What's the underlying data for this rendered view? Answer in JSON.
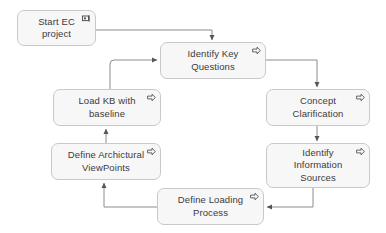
{
  "diagram": {
    "colors": {
      "node_fill": "#f7f7f7",
      "node_border": "#c9c9c9",
      "text": "#3b3b3b",
      "edge": "#8c8c8c",
      "background": "#ffffff"
    },
    "nodes": [
      {
        "id": "start-ec-project",
        "label": "Start EC\nproject",
        "marker": "start-flag-icon",
        "x": 17,
        "y": 10,
        "w": 79,
        "h": 36
      },
      {
        "id": "identify-key-questions",
        "label": "Identify Key\nQuestions",
        "marker": "process-arrow-icon",
        "x": 160,
        "y": 42,
        "w": 106,
        "h": 37
      },
      {
        "id": "concept-clarification",
        "label": "Concept\nClarification",
        "marker": "process-arrow-icon",
        "x": 266,
        "y": 89,
        "w": 104,
        "h": 37
      },
      {
        "id": "identify-information-sources",
        "label": "Identify\nInformation\nSources",
        "marker": "process-arrow-icon",
        "x": 266,
        "y": 143,
        "w": 104,
        "h": 45
      },
      {
        "id": "define-loading-process",
        "label": "Define Loading\nProcess",
        "marker": "process-arrow-icon",
        "x": 157,
        "y": 188,
        "w": 107,
        "h": 37
      },
      {
        "id": "define-archictural-viewpoints",
        "label": "Define Archictural\nViewPoints",
        "marker": "process-arrow-icon",
        "x": 51,
        "y": 143,
        "w": 110,
        "h": 37
      },
      {
        "id": "load-kb-with-baseline",
        "label": "Load KB with\nbaseline",
        "marker": "process-arrow-icon",
        "x": 53,
        "y": 89,
        "w": 108,
        "h": 37
      }
    ],
    "edges": [
      {
        "id": "edge-start-to-questions",
        "from": "start-ec-project",
        "to": "identify-key-questions",
        "arrow": "down"
      },
      {
        "id": "edge-questions-to-concept",
        "from": "identify-key-questions",
        "to": "concept-clarification",
        "arrow": "down"
      },
      {
        "id": "edge-concept-to-sources",
        "from": "concept-clarification",
        "to": "identify-information-sources",
        "arrow": "down"
      },
      {
        "id": "edge-sources-to-loading",
        "from": "identify-information-sources",
        "to": "define-loading-process",
        "arrow": "left"
      },
      {
        "id": "edge-loading-to-viewpoints",
        "from": "define-loading-process",
        "to": "define-archictural-viewpoints",
        "arrow": "up"
      },
      {
        "id": "edge-viewpoints-to-loadkb",
        "from": "define-archictural-viewpoints",
        "to": "load-kb-with-baseline",
        "arrow": "up"
      },
      {
        "id": "edge-loadkb-to-questions",
        "from": "load-kb-with-baseline",
        "to": "identify-key-questions",
        "arrow": "right"
      }
    ]
  }
}
